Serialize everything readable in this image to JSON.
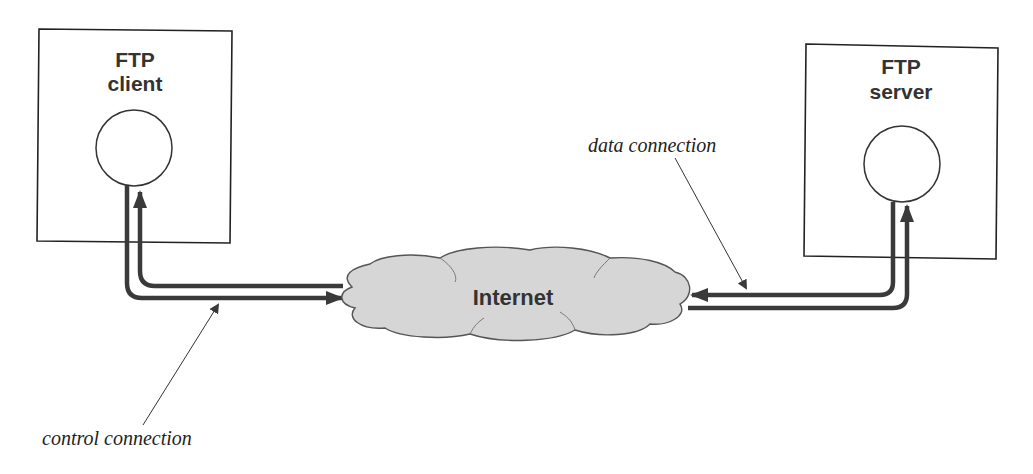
{
  "diagram": {
    "client": {
      "line1": "FTP",
      "line2": "client"
    },
    "server": {
      "line1": "FTP",
      "line2": "server"
    },
    "network": {
      "label": "Internet"
    },
    "annotations": {
      "control": "control connection",
      "data": "data connection"
    },
    "colors": {
      "line": "#3a3a3a",
      "cloud_fill": "#d6d6d6",
      "cloud_stroke": "#555555",
      "box_stroke": "#222222"
    }
  }
}
